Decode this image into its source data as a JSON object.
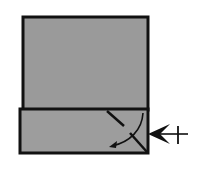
{
  "diagram": {
    "type": "origami-fold-step",
    "colors": {
      "background": "#ffffff",
      "paper": "#9a9a9a",
      "outline": "#111111"
    },
    "elements": {
      "upper_panel": {
        "x": 23,
        "y": 17,
        "w": 125,
        "h": 93
      },
      "folded_strip": {
        "x": 20,
        "y": 109,
        "w": 128,
        "h": 44
      },
      "crease_line": "diagonal valley/crease lines near right edge",
      "fold_arrow": "curved arrow pointing down-left",
      "push_arrow": "push/inside-reverse arrow with tail cross pointing left into right edge"
    }
  }
}
